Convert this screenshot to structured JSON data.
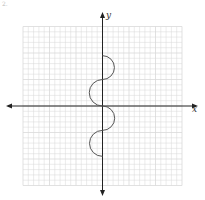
{
  "corner_mark": "2.",
  "chart_data": {
    "type": "line",
    "title": "",
    "xlabel": "x",
    "ylabel": "y",
    "xlim": [
      -15,
      15
    ],
    "ylim": [
      -15,
      15
    ],
    "grid": true,
    "grid_step": 1,
    "legend": null,
    "series": [
      {
        "name": "curve",
        "color": "#555555",
        "points": [
          {
            "x": 0,
            "y": 9.5
          },
          {
            "x": 2.2,
            "y": 7.2
          },
          {
            "x": 0,
            "y": 5
          },
          {
            "x": -2.2,
            "y": 2.5
          },
          {
            "x": 0,
            "y": 0
          },
          {
            "x": 2.2,
            "y": -2.3
          },
          {
            "x": 0,
            "y": -4.6
          },
          {
            "x": -2.2,
            "y": -7
          },
          {
            "x": 0,
            "y": -9.5
          }
        ]
      }
    ]
  },
  "labels": {
    "x_axis": "x",
    "y_axis": "y"
  },
  "colors": {
    "grid": "#d9d9d9",
    "axis": "#222222",
    "curve": "#555555"
  }
}
